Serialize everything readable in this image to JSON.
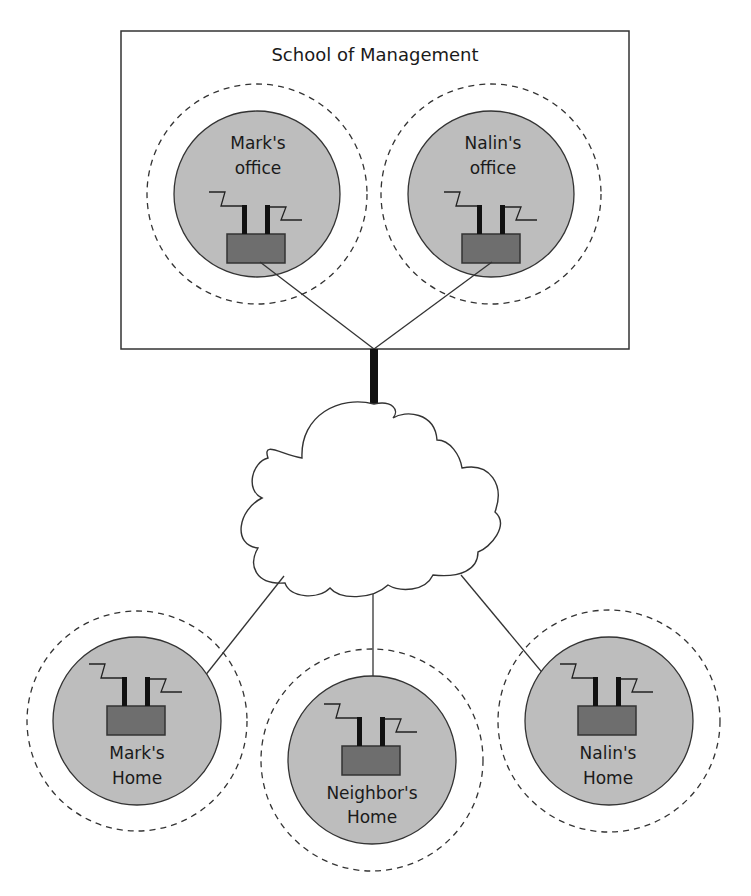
{
  "diagram": {
    "title": "School of Management",
    "colors": {
      "zone_fill": "#bdbdbd",
      "device_fill": "#6e6e6e",
      "stroke": "#333333",
      "backbone": "#111111",
      "background": "#ffffff"
    },
    "network": {
      "label": "",
      "icon": "cloud-icon"
    },
    "offices": [
      {
        "id": "marks-office",
        "line1": "Mark's",
        "line2": "office"
      },
      {
        "id": "nalins-office",
        "line1": "Nalin's",
        "line2": "office"
      }
    ],
    "homes": [
      {
        "id": "marks-home",
        "line1": "Mark's",
        "line2": "Home"
      },
      {
        "id": "neighbors-home",
        "line1": "Neighbor's",
        "line2": "Home"
      },
      {
        "id": "nalins-home",
        "line1": "Nalin's",
        "line2": "Home"
      }
    ],
    "device_icon": "wireless-access-point-icon"
  }
}
